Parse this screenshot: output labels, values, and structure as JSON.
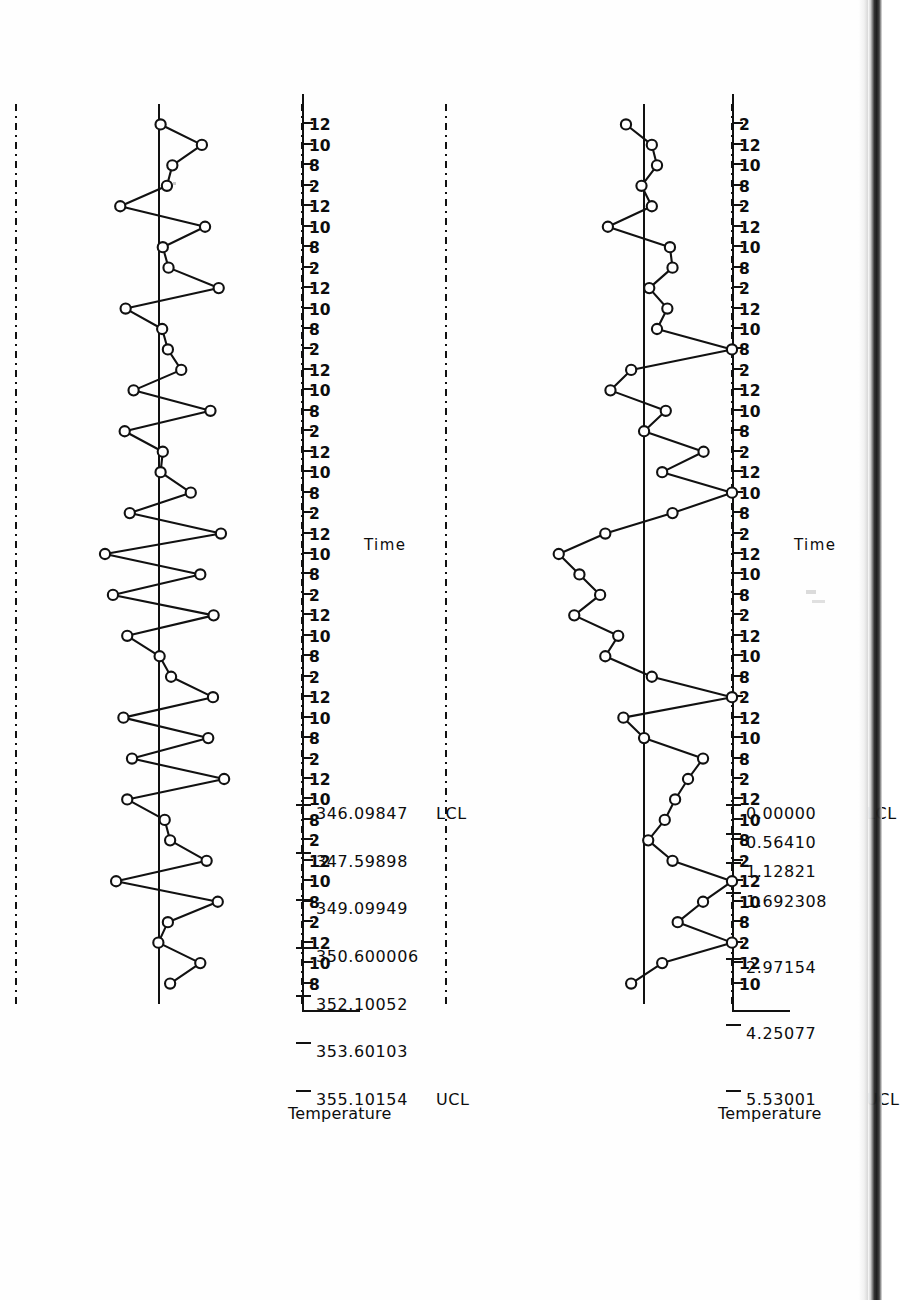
{
  "document": {
    "type": "scanned-page",
    "orientation": "rotated-90-ccw",
    "charts_count": 2
  },
  "chart_data": [
    {
      "id": "xbar-chart",
      "type": "line",
      "title": "",
      "xlabel": "Time",
      "ylabel": "Temperature",
      "ylim": [
        346.09847,
        355.10154
      ],
      "grid": false,
      "legend": "none",
      "axis_ticks": [
        {
          "value": 355.10154,
          "label": "355.10154",
          "prefix": "UCL"
        },
        {
          "value": 353.60103,
          "label": "353.60103",
          "prefix": ""
        },
        {
          "value": 352.10052,
          "label": "352.10052",
          "prefix": ""
        },
        {
          "value": 350.600006,
          "label": "350.600006",
          "prefix": ""
        },
        {
          "value": 349.09949,
          "label": "349.09949",
          "prefix": ""
        },
        {
          "value": 347.59898,
          "label": "347.59898",
          "prefix": ""
        },
        {
          "value": 346.09847,
          "label": "346.09847",
          "prefix": "LCL"
        }
      ],
      "reference_lines": [
        {
          "name": "UCL",
          "value": 355.10154,
          "style": "dash-dot"
        },
        {
          "name": "CL",
          "value": 350.600006,
          "style": "solid"
        },
        {
          "name": "LCL",
          "value": 346.09847,
          "style": "dash-dot"
        }
      ],
      "categories": [
        "8",
        "10",
        "12",
        "2",
        "8",
        "10",
        "12",
        "2",
        "8",
        "10",
        "12",
        "2",
        "8",
        "10",
        "12",
        "2",
        "8",
        "10",
        "12",
        "2",
        "8",
        "10",
        "12",
        "2",
        "8",
        "10",
        "12",
        "2",
        "8",
        "10",
        "12",
        "2",
        "8",
        "10",
        "12",
        "2",
        "8",
        "10",
        "12",
        "2",
        "8",
        "10",
        "12"
      ],
      "values": [
        350.25,
        349.3,
        350.62,
        350.32,
        348.75,
        351.95,
        349.1,
        350.25,
        350.42,
        351.6,
        348.55,
        351.45,
        349.05,
        351.72,
        348.9,
        350.22,
        350.58,
        351.6,
        348.88,
        352.05,
        349.3,
        352.3,
        348.65,
        351.52,
        349.6,
        350.55,
        350.48,
        351.68,
        348.98,
        351.4,
        349.9,
        350.32,
        350.5,
        351.65,
        348.72,
        350.3,
        350.48,
        349.15,
        351.82,
        350.35,
        350.18,
        349.25,
        350.55
      ]
    },
    {
      "id": "range-chart",
      "type": "line",
      "title": "",
      "xlabel": "Time",
      "ylabel": "Temperature",
      "ylim": [
        0.0,
        5.53001
      ],
      "grid": false,
      "legend": "none",
      "axis_ticks": [
        {
          "value": 5.53001,
          "label": "5.53001",
          "prefix": "UCL"
        },
        {
          "value": 4.25077,
          "label": "4.25077",
          "prefix": ""
        },
        {
          "value": 2.97154,
          "label": "2.97154",
          "prefix": ""
        },
        {
          "value": 1.692308,
          "label": "1.692308",
          "prefix": ""
        },
        {
          "value": 1.12821,
          "label": "1.12821",
          "prefix": ""
        },
        {
          "value": 0.5641,
          "label": "0.56410",
          "prefix": ""
        },
        {
          "value": 0.0,
          "label": "0.00000",
          "prefix": "LCL"
        }
      ],
      "reference_lines": [
        {
          "name": "UCL",
          "value": 5.53001,
          "style": "dash-dot"
        },
        {
          "name": "CL",
          "value": 1.692308,
          "style": "solid"
        },
        {
          "name": "LCL",
          "value": 0.0,
          "style": "dash-dot"
        }
      ],
      "categories": [
        "10",
        "12",
        "2",
        "8",
        "10",
        "12",
        "2",
        "8",
        "10",
        "12",
        "2",
        "8",
        "10",
        "12",
        "2",
        "8",
        "10",
        "12",
        "2",
        "8",
        "10",
        "12",
        "2",
        "8",
        "10",
        "12",
        "2",
        "8",
        "10",
        "12",
        "2",
        "8",
        "10",
        "12",
        "2",
        "8",
        "10",
        "12",
        "2",
        "8",
        "10",
        "12",
        "2"
      ],
      "values": [
        1.95,
        1.35,
        0.0,
        1.05,
        0.56,
        0.0,
        1.15,
        1.62,
        1.3,
        1.1,
        0.85,
        0.56,
        1.7,
        2.1,
        0.0,
        1.55,
        2.45,
        2.2,
        3.05,
        2.55,
        2.95,
        3.35,
        2.45,
        1.15,
        0.0,
        1.35,
        0.55,
        1.7,
        1.28,
        2.35,
        1.95,
        0.0,
        1.45,
        1.25,
        1.6,
        1.15,
        1.2,
        2.4,
        1.55,
        1.75,
        1.45,
        1.55,
        2.05
      ]
    }
  ]
}
